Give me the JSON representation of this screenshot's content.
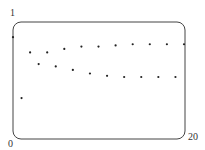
{
  "chart_data": {
    "type": "scatter",
    "title": "",
    "xlabel": "",
    "ylabel": "",
    "xlim": [
      0,
      20
    ],
    "ylim": [
      0,
      1
    ],
    "grid": false,
    "tick_labels": {
      "x_min": "0",
      "x_max": "20",
      "y_max": "1"
    },
    "x": [
      0,
      1,
      2,
      3,
      4,
      5,
      6,
      7,
      8,
      9,
      10,
      11,
      12,
      13,
      14,
      15,
      16,
      17,
      18,
      19,
      20
    ],
    "values": [
      0.87,
      0.35,
      0.74,
      0.64,
      0.74,
      0.62,
      0.77,
      0.59,
      0.79,
      0.56,
      0.79,
      0.54,
      0.8,
      0.53,
      0.81,
      0.53,
      0.81,
      0.53,
      0.81,
      0.53,
      0.81
    ]
  }
}
